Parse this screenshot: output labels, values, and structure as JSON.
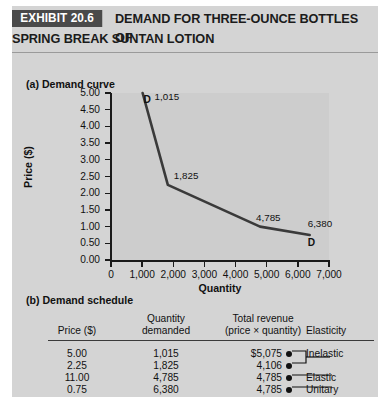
{
  "header": {
    "tag": "EXHIBIT 20.6",
    "title_line1": "DEMAND FOR THREE-OUNCE BOTTLES OF",
    "title_line2": "SPRING BREAK SUNTAN LOTION"
  },
  "panel_a": {
    "label": "(a) Demand curve"
  },
  "panel_b": {
    "label": "(b) Demand schedule"
  },
  "colors": {
    "card_background": "#d4d4d4",
    "plot_background": "#cdcdcd",
    "tag_background": "#4a4a4a",
    "curve": "#3a3a3a",
    "text": "#111111"
  },
  "chart_data": {
    "type": "line",
    "title": "",
    "xlabel": "Quantity",
    "ylabel": "Price ($)",
    "xlim": [
      0,
      7000
    ],
    "ylim": [
      0.0,
      5.0
    ],
    "grid": false,
    "legend": "none",
    "xticks": [
      0,
      1000,
      2000,
      3000,
      4000,
      5000,
      6000,
      7000
    ],
    "xticklabels": [
      "0",
      "1,000",
      "2,000",
      "3,000",
      "4,000",
      "5,000",
      "6,000",
      "7,000"
    ],
    "yticks": [
      0.0,
      0.5,
      1.0,
      1.5,
      2.0,
      2.5,
      3.0,
      3.5,
      4.0,
      4.5,
      5.0
    ],
    "yticklabels": [
      "0.00",
      "0.50",
      "1.00",
      "1.50",
      "2.00",
      "2.50",
      "3.00",
      "3.50",
      "4.00",
      "4.50",
      "5.00"
    ],
    "series": [
      {
        "name": "D",
        "x": [
          1015,
          1825,
          4785,
          6380
        ],
        "y": [
          5.0,
          2.25,
          1.0,
          0.75
        ]
      }
    ],
    "point_labels": [
      "1,015",
      "1,825",
      "4,785",
      "6,380"
    ],
    "annotations": [
      {
        "text": "D",
        "x": 1015,
        "y": 5.0
      },
      {
        "text": "D",
        "x": 6380,
        "y": 0.75
      }
    ]
  },
  "table": {
    "headers": {
      "price": "Price ($)",
      "quantity_line1": "Quantity",
      "quantity_line2": "demanded",
      "revenue_line1": "Total revenue",
      "revenue_line2": "(price × quantity)",
      "elasticity": "Elasticity"
    },
    "rows": [
      {
        "price": "5.00",
        "quantity": "1,015",
        "revenue": "$5,075",
        "elasticity": "Inelastic"
      },
      {
        "price": "2.25",
        "quantity": "1,825",
        "revenue": "4,106",
        "elasticity": ""
      },
      {
        "price": "11.00",
        "quantity": "4,785",
        "revenue": "4,785",
        "elasticity": "Elastic"
      },
      {
        "price": "0.75",
        "quantity": "6,380",
        "revenue": "4,785",
        "elasticity": "Unitary"
      }
    ]
  }
}
